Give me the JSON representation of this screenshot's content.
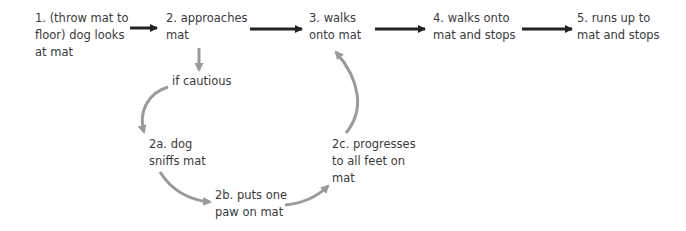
{
  "diagram": {
    "nodes": {
      "step1": "1. (throw mat to\nfloor) dog looks\nat mat",
      "step2": "2. approaches\nmat",
      "step3": "3. walks\nonto mat",
      "step4": "4. walks onto\nmat and stops",
      "step5": "5. runs up to\nmat and stops",
      "condition": "if cautious",
      "step2a": "2a. dog\nsniffs mat",
      "step2b": "2b. puts one\npaw on mat",
      "step2c": "2c. progresses\nto all feet on\nmat"
    },
    "edges": [
      {
        "from": "step1",
        "to": "step2",
        "style": "main"
      },
      {
        "from": "step2",
        "to": "step3",
        "style": "main"
      },
      {
        "from": "step3",
        "to": "step4",
        "style": "main"
      },
      {
        "from": "step4",
        "to": "step5",
        "style": "main"
      },
      {
        "from": "step2",
        "to": "condition",
        "style": "branch"
      },
      {
        "from": "condition",
        "to": "step2a",
        "style": "branch"
      },
      {
        "from": "step2a",
        "to": "step2b",
        "style": "branch"
      },
      {
        "from": "step2b",
        "to": "step2c",
        "style": "branch"
      },
      {
        "from": "step2c",
        "to": "step3",
        "style": "branch"
      }
    ],
    "colors": {
      "main_arrow": "#222222",
      "branch_arrow": "#9a9a9a",
      "text": "#3a3a3a"
    }
  }
}
